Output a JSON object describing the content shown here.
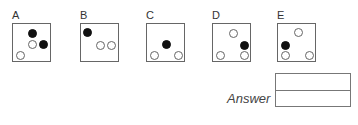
{
  "options": [
    {
      "label": "A",
      "left": 12,
      "dots": [
        {
          "type": "filled",
          "x": 15,
          "y": 5
        },
        {
          "type": "open",
          "x": 15,
          "y": 16
        },
        {
          "type": "filled",
          "x": 26,
          "y": 16
        },
        {
          "type": "open",
          "x": 3,
          "y": 27
        }
      ]
    },
    {
      "label": "B",
      "left": 80,
      "dots": [
        {
          "type": "filled",
          "x": 2,
          "y": 4
        },
        {
          "type": "open",
          "x": 15,
          "y": 17
        },
        {
          "type": "open",
          "x": 26,
          "y": 17
        }
      ]
    },
    {
      "label": "C",
      "left": 146,
      "dots": [
        {
          "type": "filled",
          "x": 15,
          "y": 16
        },
        {
          "type": "open",
          "x": 3,
          "y": 27
        },
        {
          "type": "open",
          "x": 27,
          "y": 27
        }
      ]
    },
    {
      "label": "D",
      "left": 212,
      "dots": [
        {
          "type": "open",
          "x": 16,
          "y": 5
        },
        {
          "type": "filled",
          "x": 27,
          "y": 17
        },
        {
          "type": "open",
          "x": 3,
          "y": 27
        },
        {
          "type": "open",
          "x": 27,
          "y": 27
        }
      ]
    },
    {
      "label": "E",
      "left": 277,
      "dots": [
        {
          "type": "open",
          "x": 16,
          "y": 4
        },
        {
          "type": "filled",
          "x": 3,
          "y": 17
        },
        {
          "type": "open",
          "x": 3,
          "y": 27
        },
        {
          "type": "open",
          "x": 27,
          "y": 27
        }
      ]
    }
  ],
  "answer": {
    "label": "Answer",
    "rows": [
      "",
      ""
    ]
  }
}
